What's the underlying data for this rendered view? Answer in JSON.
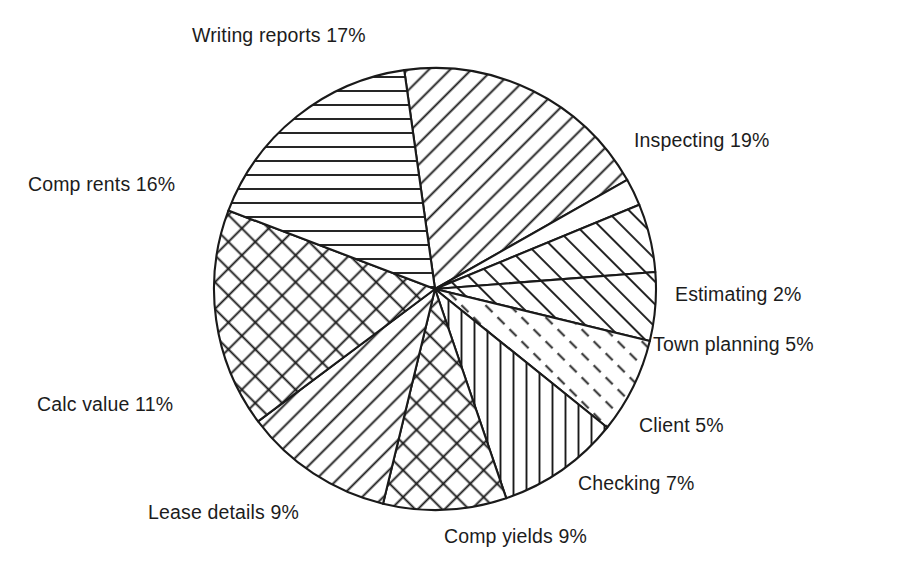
{
  "chart_data": {
    "type": "pie",
    "title": "",
    "subtitle": "",
    "xlabel": "",
    "ylabel": "",
    "legend_position": "none",
    "grid": false,
    "unit": "%",
    "total": 100,
    "start_angle_deg": -8,
    "direction": "clockwise",
    "center": {
      "x": 435,
      "y": 289
    },
    "radius": 221,
    "categories": [
      "Inspecting",
      "Estimating",
      "Town planning",
      "Client",
      "Checking",
      "Comp yields",
      "Lease details",
      "Calc value",
      "Comp rents",
      "Writing reports"
    ],
    "values": [
      19,
      2,
      5,
      5,
      7,
      9,
      9,
      11,
      16,
      17
    ],
    "slices": [
      {
        "name": "Inspecting",
        "value": 19,
        "label": "Inspecting 19%",
        "pattern": "diagonal-backslash",
        "label_pos": {
          "x": 634,
          "y": 131
        },
        "align": "right"
      },
      {
        "name": "Estimating",
        "value": 2,
        "label": "Estimating 2%",
        "pattern": "blank",
        "label_pos": {
          "x": 675,
          "y": 285
        },
        "align": "right"
      },
      {
        "name": "Town planning",
        "value": 5,
        "label": "Town planning 5%",
        "pattern": "diagonal-slash",
        "label_pos": {
          "x": 653,
          "y": 335
        },
        "align": "right"
      },
      {
        "name": "Client",
        "value": 5,
        "label": "Client 5%",
        "pattern": "diagonal-slash",
        "label_pos": {
          "x": 639,
          "y": 416
        },
        "align": "right"
      },
      {
        "name": "Checking",
        "value": 7,
        "label": "Checking 7%",
        "pattern": "dashed-diagonal",
        "label_pos": {
          "x": 578,
          "y": 474
        },
        "align": "right"
      },
      {
        "name": "Comp yields",
        "value": 9,
        "label": "Comp yields 9%",
        "pattern": "vertical",
        "label_pos": {
          "x": 444,
          "y": 527
        },
        "align": "right"
      },
      {
        "name": "Lease details",
        "value": 9,
        "label": "Lease details 9%",
        "pattern": "crosshatch",
        "label_pos": {
          "x": 148,
          "y": 503
        },
        "align": "right"
      },
      {
        "name": "Calc value",
        "value": 11,
        "label": "Calc value 11%",
        "pattern": "diagonal-backslash",
        "label_pos": {
          "x": 37,
          "y": 395
        },
        "align": "right"
      },
      {
        "name": "Comp rents",
        "value": 16,
        "label": "Comp rents 16%",
        "pattern": "crosshatch",
        "label_pos": {
          "x": 28,
          "y": 175
        },
        "align": "right"
      },
      {
        "name": "Writing reports",
        "value": 17,
        "label": "Writing reports 17%",
        "pattern": "horizontal",
        "label_pos": {
          "x": 192,
          "y": 26
        },
        "align": "right"
      }
    ]
  }
}
